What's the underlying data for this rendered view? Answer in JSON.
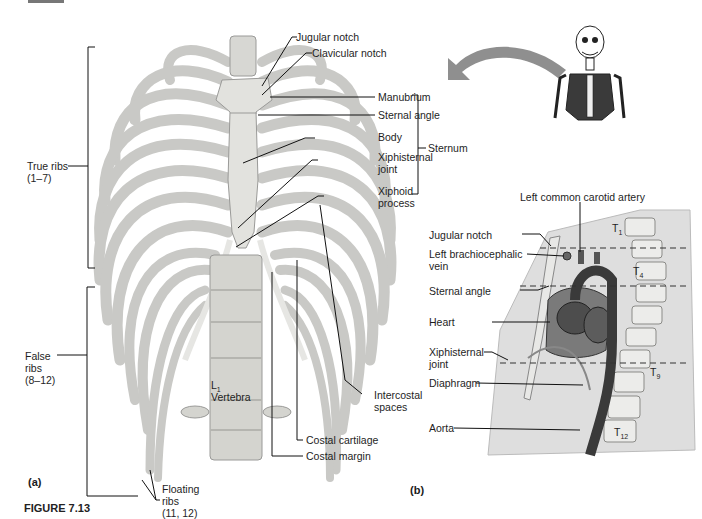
{
  "figure": {
    "top_tab": "",
    "caption_prefix": "FIGURE 7.13",
    "panel_a_label": "(a)",
    "panel_b_label": "(b)"
  },
  "panel_a": {
    "title": "Thoracic cage (anterior view)",
    "labels": {
      "jugular_notch": "Jugular notch",
      "clavicular_notch": "Clavicular notch",
      "manubrium": "Manubrium",
      "sternal_angle": "Sternal angle",
      "body": "Body",
      "xiphisternal_joint": "Xiphisternal\njoint",
      "xiphoid_process": "Xiphoid\nprocess",
      "sternum": "Sternum",
      "true_ribs": "True ribs\n(1–7)",
      "false_ribs": "False\nribs\n(8–12)",
      "floating_ribs": "Floating\nribs\n(11, 12)",
      "l1": "L",
      "l1_sub": "1",
      "vertebra": "Vertebra",
      "intercostal_spaces": "Intercostal\nspaces",
      "costal_cartilage": "Costal cartilage",
      "costal_margin": "Costal margin"
    }
  },
  "panel_b": {
    "labels": {
      "left_common_carotid_artery": "Left common carotid artery",
      "jugular_notch": "Jugular notch",
      "left_brachiocephalic_vein": "Left brachiocephalic\nvein",
      "sternal_angle": "Sternal angle",
      "heart": "Heart",
      "xiphisternal_joint": "Xiphisternal\njoint",
      "diaphragm": "Diaphragm",
      "aorta": "Aorta",
      "t1": "T",
      "t1_sub": "1",
      "t4": "T",
      "t4_sub": "4",
      "t9": "T",
      "t9_sub": "9",
      "t12": "T",
      "t12_sub": "12"
    }
  },
  "colors": {
    "bone": "#d9d9d6",
    "bone_shadow": "#a9a9a6",
    "tissue": "#dcdcdc",
    "vessel": "#3a3a3a",
    "arrow": "#8f8f8f"
  }
}
